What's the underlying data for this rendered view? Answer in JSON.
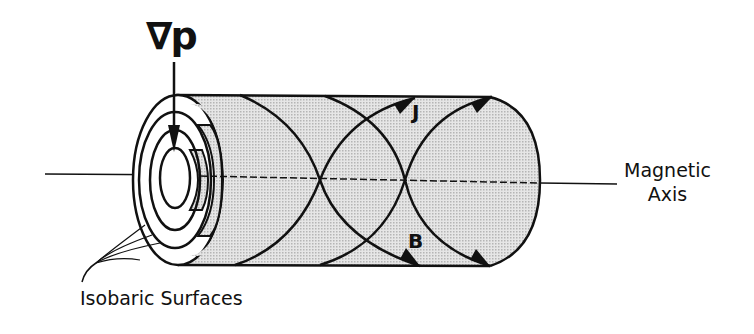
{
  "figure": {
    "labels": {
      "pressure_gradient": "∇p",
      "current_density": "J",
      "magnetic_field": "B",
      "axis_line1": "Magnetic",
      "axis_line2": "Axis",
      "isobaric_surfaces": "Isobaric Surfaces"
    },
    "colors": {
      "line": "#111111",
      "shading": "#d9d9d9",
      "background": "#ffffff"
    }
  }
}
